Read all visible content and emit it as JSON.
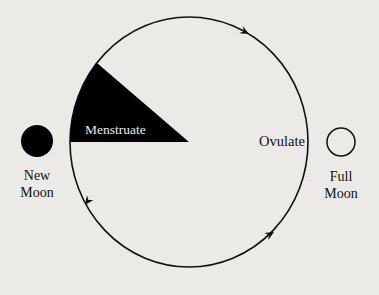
{
  "diagram": {
    "title": "",
    "type": "menstrual-lunar-cycle",
    "colors": {
      "background": "#ebeae7",
      "ink": "#111111",
      "sector_label": "#e8e8e8"
    },
    "cycle": {
      "direction": "counter-clockwise",
      "sector_label": "Menstruate",
      "ovulate_label": "Ovulate"
    },
    "new_moon": {
      "line1": "New",
      "line2": "Moon",
      "fill": "filled"
    },
    "full_moon": {
      "line1": "Full",
      "line2": "Moon",
      "fill": "outline"
    }
  }
}
